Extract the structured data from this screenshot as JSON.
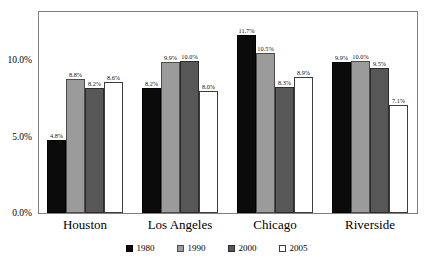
{
  "chart_data": {
    "type": "bar",
    "title": "",
    "subtitle": "",
    "xlabel": "",
    "ylabel": "",
    "categories": [
      "Houston",
      "Los Angeles",
      "Chicago",
      "Riverside"
    ],
    "series": [
      {
        "name": "1980",
        "color": "#0b0b0b",
        "values": [
          4.8,
          8.2,
          11.7,
          9.9
        ]
      },
      {
        "name": "1990",
        "color": "#9b9b9b",
        "values": [
          8.8,
          9.9,
          10.5,
          10.0
        ]
      },
      {
        "name": "2000",
        "color": "#575757",
        "values": [
          8.2,
          10.0,
          8.3,
          9.5
        ]
      },
      {
        "name": "2005",
        "color": "#ffffff",
        "values": [
          8.6,
          8.0,
          8.9,
          7.1
        ]
      }
    ],
    "value_labels": [
      [
        "4.8%",
        "8.8%",
        "8.2%",
        "8.6%"
      ],
      [
        "8.2%",
        "9.9%",
        "10.0%",
        "8.0%"
      ],
      [
        "11.7%",
        "10.5%",
        "8.3%",
        "8.9%"
      ],
      [
        "9.9%",
        "10.0%",
        "9.5%",
        "7.1%"
      ]
    ],
    "ylim": [
      0.0,
      13.2
    ],
    "yticks": [
      0.0,
      5.0,
      10.0
    ],
    "ytick_labels": [
      "0.0%",
      "5.0%",
      "10.0%"
    ],
    "grid": false,
    "legend_position": "bottom",
    "frame": true
  },
  "legend": {
    "items": [
      {
        "label": "1980"
      },
      {
        "label": "1990"
      },
      {
        "label": "2000"
      },
      {
        "label": "2005"
      }
    ]
  }
}
